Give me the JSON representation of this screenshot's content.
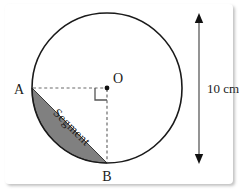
{
  "figure": {
    "shape": "circle",
    "background_color": "#ffffff",
    "stroke_color": "#1a1a1a",
    "segment_fill_color": "#808080",
    "segment_stroke_color": "#3a3a3a",
    "dashed_line_color": "#6b6b6b"
  },
  "circle": {
    "center_label": "O",
    "center_x": 107,
    "center_y": 88,
    "radius": 75
  },
  "points": {
    "a_label": "A",
    "b_label": "B",
    "o_label": "O"
  },
  "segment": {
    "label": "Segment",
    "rotation_degrees": 45
  },
  "dimension": {
    "label": "10 cm",
    "value": "10",
    "unit": "cm",
    "measures": "diameter",
    "arrow_top_y": 14,
    "arrow_bottom_y": 163
  },
  "markers": {
    "right_angle": "right-angle-marker"
  }
}
